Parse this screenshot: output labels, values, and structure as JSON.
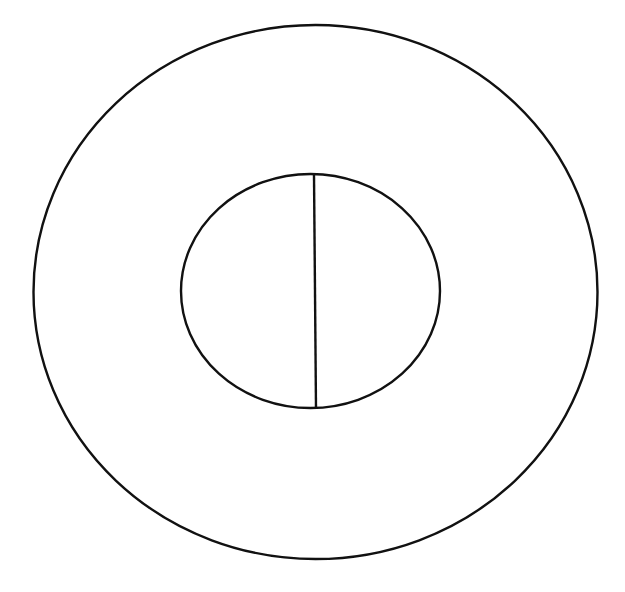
{
  "canvas": {
    "width": 625,
    "height": 592,
    "background": "#ffffff"
  },
  "stroke": {
    "color": "#111111",
    "width": 2.4
  },
  "shapes": {
    "outer_circle": {
      "cx": 315.5,
      "cy": 292,
      "rx": 282,
      "ry": 267
    },
    "inner_circle": {
      "cx": 310.5,
      "cy": 291,
      "rx": 129.5,
      "ry": 117
    },
    "divider_line": {
      "x1": 314,
      "y1": 175,
      "x2": 316,
      "y2": 408
    }
  }
}
